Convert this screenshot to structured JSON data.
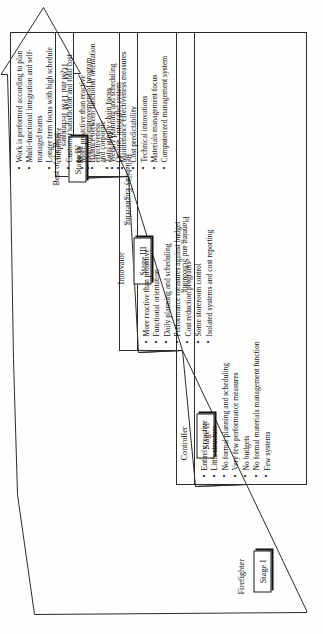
{
  "diagram": {
    "type": "maintenance-maturity-arrow",
    "orientation": "rotated-90-ccw",
    "line_color": "#2b2b2b",
    "background": "#fdfdfc",
    "stages": [
      {
        "id": "stage-1",
        "stage_label": "Stage I",
        "role": "Firefighter",
        "bullets": [
          "Entirely reactive",
          "Little structure",
          "No formal planning and scheduling",
          "Very few performance measures",
          "No budgets",
          "No formal materials management function",
          "Few systems"
        ]
      },
      {
        "id": "stage-2",
        "stage_label": "Stage II",
        "role": "Controller",
        "bullets": [
          "More reactive than proactive",
          "Functional orientation",
          "Daily planning and scheduling",
          "Performance measures against budget",
          "Cost reduction programs",
          "Some storeroom control",
          "Isolated systems and cost reporting"
        ]
      },
      {
        "id": "stage-3",
        "stage_label": "Stage III",
        "role": "Innovator",
        "bullets": [
          "More proactive than reactive",
          "Balance between functional orientation and corporate",
          "Weekly planning and scheduling",
          "Maintenance effectiveness measures",
          "Cost predictability",
          "Technical innovations",
          "Materials management focus",
          "Computerized management system"
        ]
      },
      {
        "id": "stage-4",
        "stage_label": "Stage IV",
        "role": "Best of the Best",
        "bullets": [
          "Work is performed according to plan",
          "Multi-functional integration and self-managed teams",
          "Longer term focus with high schedule compliance",
          "Customer satisfaction and total cost focus",
          "Ongoing improvement of program effectiveness",
          "Total supply chain focus",
          "On-line, integrated system"
        ]
      }
    ],
    "transition_bands": [
      {
        "id": "band-1",
        "label": "Planning and Scheduling"
      },
      {
        "id": "band-2",
        "label": "Reliability Engineering"
      },
      {
        "id": "band-3",
        "label": "TQM and TPM Techniques"
      }
    ]
  }
}
